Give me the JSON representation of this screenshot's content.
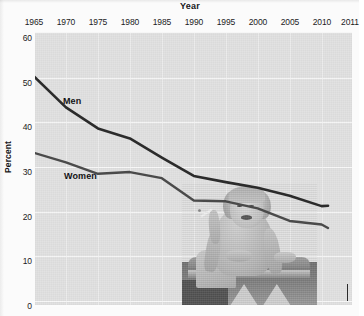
{
  "chart_data": {
    "type": "line",
    "title": "Year",
    "xlabel": "Year",
    "ylabel": "Percent",
    "xlim": [
      1965,
      2011
    ],
    "ylim": [
      0,
      60
    ],
    "grid": true,
    "legend": "inline-labels",
    "x_ticks": [
      "1965",
      "1970",
      "1975",
      "1980",
      "1985",
      "1990",
      "1995",
      "2000",
      "2005",
      "2010",
      "2011"
    ],
    "x_tick_values": [
      1965,
      1970,
      1975,
      1980,
      1985,
      1990,
      1995,
      2000,
      2005,
      2010,
      2011
    ],
    "y_ticks": [
      "0",
      "10",
      "20",
      "30",
      "40",
      "50",
      "60"
    ],
    "y_tick_values": [
      0,
      10,
      20,
      30,
      40,
      50,
      60
    ],
    "x": [
      1965,
      1970,
      1975,
      1980,
      1985,
      1990,
      1995,
      2000,
      2005,
      2010,
      2011
    ],
    "series": [
      {
        "name": "Men",
        "label": "Men",
        "color": "#2b2b2b",
        "values": [
          51.2,
          44.1,
          39.3,
          37.0,
          32.6,
          28.4,
          27.0,
          25.7,
          23.9,
          21.5,
          21.6
        ]
      },
      {
        "name": "Women",
        "label": "Women",
        "color": "#4a4a4a",
        "values": [
          33.7,
          31.5,
          28.9,
          29.3,
          27.9,
          22.8,
          22.6,
          21.0,
          18.1,
          17.3,
          16.5
        ]
      }
    ],
    "annotations": [
      {
        "text": "Men",
        "x": 1969,
        "y": 46
      },
      {
        "text": "Women",
        "x": 1969,
        "y": 25.5
      }
    ],
    "overlay_image": {
      "description": "vintage black-and-white photograph of a smiling woman holding a cigarette, seated and leaning on a bench",
      "position": "bottom-right"
    }
  },
  "axes": {
    "x_title": "Year",
    "y_title": "Percent"
  }
}
